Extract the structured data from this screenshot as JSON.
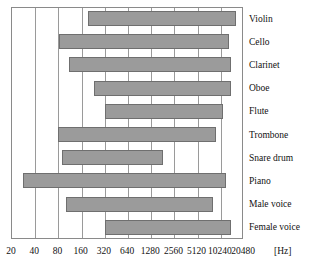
{
  "chart_data": {
    "type": "bar",
    "orientation": "horizontal-range",
    "title": "",
    "xlabel": "[Hz]",
    "ylabel": "",
    "grid": true,
    "legend": false,
    "x_scale": "log2",
    "xlim": [
      20,
      20480
    ],
    "x_ticks": [
      20,
      40,
      80,
      160,
      320,
      640,
      1280,
      2560,
      5120,
      10240,
      20480
    ],
    "x_tick_labels": [
      "20",
      "40",
      "80",
      "160",
      "320",
      "640",
      "1280",
      "2560",
      "5120",
      "10240",
      "20480"
    ],
    "x_unit_label": "[Hz]",
    "categories": [
      "Violin",
      "Cello",
      "Clarinet",
      "Oboe",
      "Flute",
      "Trombone",
      "Snare drum",
      "Piano",
      "Male voice",
      "Female voice"
    ],
    "series": [
      {
        "name": "Frequency range",
        "ranges": [
          {
            "label": "Violin",
            "low": 196,
            "high": 16000
          },
          {
            "label": "Cello",
            "low": 82,
            "high": 13000
          },
          {
            "label": "Clarinet",
            "low": 110,
            "high": 14000
          },
          {
            "label": "Oboe",
            "low": 230,
            "high": 14000
          },
          {
            "label": "Flute",
            "low": 320,
            "high": 11000
          },
          {
            "label": "Trombone",
            "low": 80,
            "high": 9000
          },
          {
            "label": "Snare drum",
            "low": 90,
            "high": 1800
          },
          {
            "label": "Piano",
            "low": 27.5,
            "high": 12000
          },
          {
            "label": "Male voice",
            "low": 100,
            "high": 8000
          },
          {
            "label": "Female voice",
            "low": 320,
            "high": 14000
          }
        ]
      }
    ],
    "colors": {
      "bar_fill": "#9b9b9b",
      "bar_edge": "#6f6f6f",
      "grid": "#9a9a9a",
      "frame": "#8a8a8a",
      "text": "#111111",
      "background": "#ffffff"
    }
  }
}
